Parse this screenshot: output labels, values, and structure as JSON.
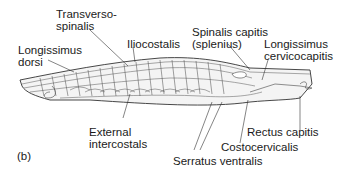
{
  "figure": {
    "panel_label": "(b)"
  },
  "labels": {
    "transversospinalis": [
      "Transverso-",
      "spinalis"
    ],
    "iliocostalis": [
      "Iliocostalis"
    ],
    "longissimus_dorsi": [
      "Longissimus",
      "dorsi"
    ],
    "spinalis_capitis": [
      "Spinalis capitis",
      "(splenius)"
    ],
    "longissimus_cervicocapitis": [
      "Longissimus",
      "cervicocapitis"
    ],
    "external_intercostals": [
      "External",
      "intercostals"
    ],
    "rectus_capitis": [
      "Rectus capitis"
    ],
    "costocervicalis": [
      "Costocervicalis"
    ],
    "serratus_ventralis": [
      "Serratus ventralis"
    ]
  },
  "colors": {
    "line": "#333333",
    "fill": "#f2f2f2",
    "text": "#1a1a1a"
  }
}
